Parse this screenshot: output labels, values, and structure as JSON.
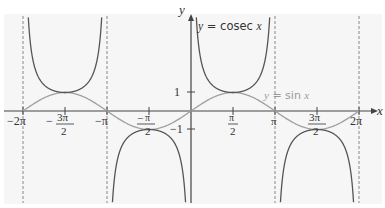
{
  "chart_data": {
    "type": "line",
    "title": "",
    "xlabel": "x",
    "ylabel": "y",
    "x_range": [
      -6.2832,
      6.2832
    ],
    "y_range": [
      -5,
      5
    ],
    "grid": false,
    "x_ticks": [
      "-2π",
      "-3π/2",
      "-π",
      "-π/2",
      "π/2",
      "π",
      "3π/2",
      "2π"
    ],
    "y_ticks": [
      "1",
      "-1"
    ],
    "asymptotes": [
      "-2π",
      "-π",
      "π",
      "2π"
    ],
    "series": [
      {
        "name": "y = cosec x",
        "color": "#555555",
        "expr": "1/sin(x)",
        "key_points": [
          {
            "x": "-3π/2",
            "y": 1
          },
          {
            "x": "-π/2",
            "y": -1
          },
          {
            "x": "π/2",
            "y": 1
          },
          {
            "x": "3π/2",
            "y": -1
          }
        ]
      },
      {
        "name": "y = sin x",
        "color": "#9a9a9a",
        "expr": "sin(x)",
        "key_points": [
          {
            "x": "-2π",
            "y": 0
          },
          {
            "x": "-3π/2",
            "y": 1
          },
          {
            "x": "-π",
            "y": 0
          },
          {
            "x": "-π/2",
            "y": -1
          },
          {
            "x": "0",
            "y": 0
          },
          {
            "x": "π/2",
            "y": 1
          },
          {
            "x": "π",
            "y": 0
          },
          {
            "x": "3π/2",
            "y": -1
          },
          {
            "x": "2π",
            "y": 0
          }
        ]
      }
    ],
    "annotations": [
      {
        "text": "y = cosec x",
        "near": "top, right of y-axis"
      },
      {
        "text": "y = sin x",
        "near": "between π/2 and π, above x-axis"
      }
    ]
  },
  "labels": {
    "y_axis": "y",
    "x_axis": "x",
    "cosec": "y = cosec x",
    "sin": "y = sin x",
    "one": "1",
    "neg_one": "−1",
    "tick_neg2pi": "−2π",
    "tick_negpi": "−π",
    "tick_pi": "π",
    "tick_2pi": "2π",
    "neg": "−",
    "pi": "π",
    "three_pi": "3π",
    "two": "2"
  }
}
